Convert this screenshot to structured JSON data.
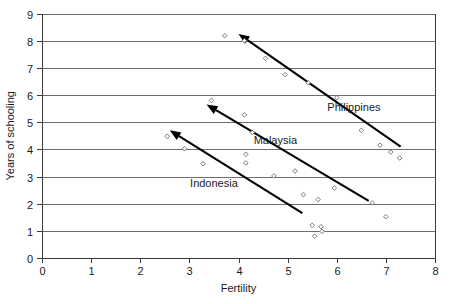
{
  "chart_data": {
    "type": "scatter",
    "title": "",
    "xlabel": "Fertility",
    "ylabel": "Years of schooling",
    "xlim": [
      0,
      8
    ],
    "ylim": [
      0,
      9
    ],
    "xticks": [
      0,
      1,
      2,
      3,
      4,
      5,
      6,
      7,
      8
    ],
    "yticks": [
      0,
      1,
      2,
      3,
      4,
      5,
      6,
      7,
      8,
      9
    ],
    "grid": "horizontal",
    "legend_position": "inline-annotations",
    "series": [
      {
        "name": "Philippines",
        "label": "Philippines",
        "label_x": 6.35,
        "label_y": 5.55,
        "points": [
          {
            "x": 3.72,
            "y": 8.18
          },
          {
            "x": 4.12,
            "y": 8.0
          },
          {
            "x": 4.55,
            "y": 7.35
          },
          {
            "x": 4.95,
            "y": 6.75
          },
          {
            "x": 5.42,
            "y": 6.45
          },
          {
            "x": 6.0,
            "y": 5.9
          },
          {
            "x": 6.5,
            "y": 4.7
          },
          {
            "x": 6.88,
            "y": 4.15
          },
          {
            "x": 7.1,
            "y": 3.9
          },
          {
            "x": 7.28,
            "y": 3.68
          }
        ],
        "trend": {
          "x1": 4.0,
          "y1": 8.25,
          "x2": 7.3,
          "y2": 4.1,
          "arrow_at": "start"
        }
      },
      {
        "name": "Malaysia",
        "label": "Malaysia",
        "label_x": 4.75,
        "label_y": 4.35,
        "points": [
          {
            "x": 3.45,
            "y": 5.8
          },
          {
            "x": 4.12,
            "y": 5.27
          },
          {
            "x": 4.28,
            "y": 4.62
          },
          {
            "x": 4.15,
            "y": 3.82
          },
          {
            "x": 5.15,
            "y": 3.2
          },
          {
            "x": 5.32,
            "y": 2.33
          },
          {
            "x": 5.62,
            "y": 2.15
          },
          {
            "x": 5.95,
            "y": 2.58
          },
          {
            "x": 6.72,
            "y": 2.03
          },
          {
            "x": 7.0,
            "y": 1.52
          }
        ],
        "trend": {
          "x1": 3.35,
          "y1": 5.65,
          "x2": 6.65,
          "y2": 2.1,
          "arrow_at": "start"
        }
      },
      {
        "name": "Indonesia",
        "label": "Indonesia",
        "label_x": 3.5,
        "label_y": 2.75,
        "points": [
          {
            "x": 2.55,
            "y": 4.48
          },
          {
            "x": 2.9,
            "y": 4.02
          },
          {
            "x": 3.28,
            "y": 3.47
          },
          {
            "x": 4.15,
            "y": 3.5
          },
          {
            "x": 4.72,
            "y": 3.02
          },
          {
            "x": 5.5,
            "y": 1.2
          },
          {
            "x": 5.55,
            "y": 0.8
          },
          {
            "x": 5.68,
            "y": 1.15
          },
          {
            "x": 5.7,
            "y": 0.98
          }
        ],
        "trend": {
          "x1": 2.6,
          "y1": 4.7,
          "x2": 5.3,
          "y2": 1.65,
          "arrow_at": "start"
        }
      }
    ]
  }
}
